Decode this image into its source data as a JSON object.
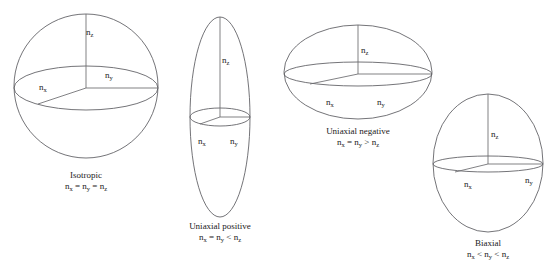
{
  "figure": {
    "background_color": "#ffffff",
    "line_color": "#5b5b60",
    "text_color": "#1a1a1a",
    "clipped_header_text": ""
  },
  "diagrams": [
    {
      "id": "isotropic",
      "shape": "sphere",
      "caption_name": "Isotropic",
      "caption_relation": "n_x = n_y = n_z",
      "axis_labels": {
        "nz": "n",
        "nz_sub": "z",
        "nx": "n",
        "nx_sub": "x",
        "ny": "n",
        "ny_sub": "y"
      }
    },
    {
      "id": "uniaxial-positive",
      "shape": "prolate-ellipsoid",
      "caption_name": "Uniaxial positive",
      "caption_relation": "n_x = n_y < n_z",
      "axis_labels": {
        "nz": "n",
        "nz_sub": "z",
        "nx": "n",
        "nx_sub": "x",
        "ny": "n",
        "ny_sub": "y"
      }
    },
    {
      "id": "uniaxial-negative",
      "shape": "oblate-ellipsoid",
      "caption_name": "Uniaxial negative",
      "caption_relation": "n_x = n_y > n_z",
      "axis_labels": {
        "nz": "n",
        "nz_sub": "z",
        "nx": "n",
        "nx_sub": "x",
        "ny": "n",
        "ny_sub": "y"
      }
    },
    {
      "id": "biaxial",
      "shape": "triaxial-ellipsoid",
      "caption_name": "Biaxial",
      "caption_relation": "n_x < n_y < n_z",
      "axis_labels": {
        "nz": "n",
        "nz_sub": "z",
        "nx": "n",
        "nx_sub": "x",
        "ny": "n",
        "ny_sub": "y"
      }
    }
  ],
  "captions": {
    "isotropic_name": "Isotropic",
    "isotropic_rel_a": "n",
    "isotropic_rel_a_sub": "x",
    "isotropic_rel_op1": " = ",
    "isotropic_rel_b": "n",
    "isotropic_rel_b_sub": "y",
    "isotropic_rel_op2": " = ",
    "isotropic_rel_c": "n",
    "isotropic_rel_c_sub": "z",
    "uniaxial_positive_name": "Uniaxial positive",
    "uniaxial_positive_rel_a": "n",
    "uniaxial_positive_rel_a_sub": "x",
    "uniaxial_positive_rel_op1": " = ",
    "uniaxial_positive_rel_b": "n",
    "uniaxial_positive_rel_b_sub": "y",
    "uniaxial_positive_rel_op2": " < ",
    "uniaxial_positive_rel_c": "n",
    "uniaxial_positive_rel_c_sub": "z",
    "uniaxial_negative_name": "Uniaxial negative",
    "uniaxial_negative_rel_a": "n",
    "uniaxial_negative_rel_a_sub": "x",
    "uniaxial_negative_rel_op1": " = ",
    "uniaxial_negative_rel_b": "n",
    "uniaxial_negative_rel_b_sub": "y",
    "uniaxial_negative_rel_op2": " > ",
    "uniaxial_negative_rel_c": "n",
    "uniaxial_negative_rel_c_sub": "z",
    "biaxial_name": "Biaxial",
    "biaxial_rel_a": "n",
    "biaxial_rel_a_sub": "x",
    "biaxial_rel_op1": " < ",
    "biaxial_rel_b": "n",
    "biaxial_rel_b_sub": "y",
    "biaxial_rel_op2": " < ",
    "biaxial_rel_c": "n",
    "biaxial_rel_c_sub": "z"
  },
  "labels": {
    "n": "n",
    "sub_x": "x",
    "sub_y": "y",
    "sub_z": "z"
  }
}
